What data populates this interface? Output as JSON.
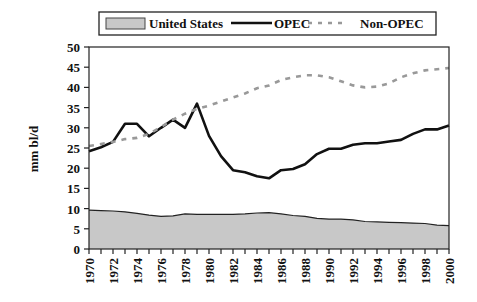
{
  "chart_data": {
    "type": "line",
    "title": "",
    "xlabel": "",
    "ylabel": "mm bl/d",
    "ylim": [
      0,
      50
    ],
    "yticks": [
      0,
      5,
      10,
      15,
      20,
      25,
      30,
      35,
      40,
      45,
      50
    ],
    "xlim": [
      1970,
      2000
    ],
    "xtick_labels": [
      "1970",
      "1972",
      "1974",
      "1976",
      "1978",
      "1980",
      "1982",
      "1984",
      "1986",
      "1988",
      "1990",
      "1992",
      "1994",
      "1996",
      "1998",
      "2000"
    ],
    "grid": false,
    "legend_position": "top",
    "x": [
      1970,
      1971,
      1972,
      1973,
      1974,
      1975,
      1976,
      1977,
      1978,
      1979,
      1980,
      1981,
      1982,
      1983,
      1984,
      1985,
      1986,
      1987,
      1988,
      1989,
      1990,
      1991,
      1992,
      1993,
      1994,
      1995,
      1996,
      1997,
      1998,
      1999,
      2000
    ],
    "series": [
      {
        "name": "United States",
        "style": "area",
        "color": "#c8c8c8",
        "values": [
          9.6,
          9.5,
          9.4,
          9.2,
          8.8,
          8.4,
          8.1,
          8.2,
          8.7,
          8.6,
          8.6,
          8.6,
          8.6,
          8.7,
          8.9,
          9.0,
          8.7,
          8.3,
          8.1,
          7.6,
          7.4,
          7.4,
          7.2,
          6.8,
          6.7,
          6.6,
          6.5,
          6.4,
          6.3,
          5.9,
          5.8
        ]
      },
      {
        "name": "OPEC",
        "style": "solid",
        "color": "#111111",
        "values": [
          24.2,
          25.2,
          26.5,
          31.0,
          31.0,
          27.9,
          30.0,
          32.0,
          30.0,
          36.0,
          28.0,
          23.0,
          19.5,
          19.0,
          18.0,
          17.5,
          19.5,
          19.8,
          21.0,
          23.5,
          24.8,
          24.8,
          25.8,
          26.2,
          26.2,
          26.6,
          27.0,
          28.5,
          29.6,
          29.6,
          30.6
        ]
      },
      {
        "name": "Non-OPEC",
        "style": "dashed",
        "color": "#999999",
        "values": [
          25.5,
          26.0,
          26.5,
          27.2,
          27.5,
          28.5,
          30.2,
          32.0,
          33.5,
          34.7,
          35.5,
          36.5,
          37.5,
          38.5,
          39.8,
          40.5,
          41.8,
          42.5,
          43.0,
          43.0,
          42.5,
          41.5,
          40.5,
          40.0,
          40.2,
          41.0,
          42.5,
          43.5,
          44.2,
          44.5,
          44.8
        ]
      }
    ]
  },
  "legend": {
    "items": [
      "United States",
      "OPEC",
      "Non-OPEC"
    ]
  },
  "axis": {
    "ylabel": "mm bl/d"
  }
}
